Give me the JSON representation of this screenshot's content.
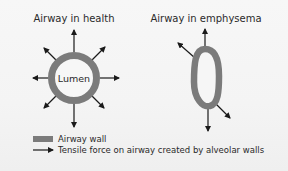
{
  "diagram": {
    "healthy": {
      "title": "Airway in health",
      "lumen_label": "Lumen"
    },
    "emphysema": {
      "title": "Airway in emphysema"
    },
    "legend": {
      "items": [
        {
          "symbol": "gray-bar",
          "label": "Airway wall"
        },
        {
          "symbol": "arrow",
          "label": "Tensile force on airway created by alveolar walls"
        }
      ]
    },
    "colors": {
      "airway_wall": "#7b7b7b",
      "arrow": "#1a1a1a",
      "background": "#f4f4f4",
      "text": "#2a2a2a"
    }
  }
}
